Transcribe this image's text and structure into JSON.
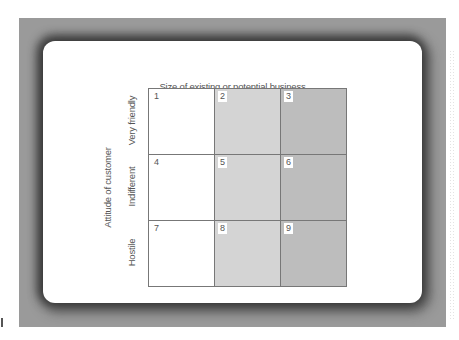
{
  "diagram": {
    "title": "Size of existing or potential business",
    "y_axis_label": "Attitude of customer",
    "columns": [
      {
        "label": "Large",
        "fill": "#ffffff"
      },
      {
        "label": "Medium",
        "fill": "#d4d4d4"
      },
      {
        "label": "Small",
        "fill": "#bdbdbd"
      }
    ],
    "rows": [
      {
        "label": "Very friendly"
      },
      {
        "label": "Indifferent"
      },
      {
        "label": "Hostile"
      }
    ],
    "cells": [
      "1",
      "2",
      "3",
      "4",
      "5",
      "6",
      "7",
      "8",
      "9"
    ],
    "colors": {
      "frame": "#9a9a9a",
      "card": "#ffffff",
      "grid_line": "#777777",
      "text": "#555555"
    }
  }
}
